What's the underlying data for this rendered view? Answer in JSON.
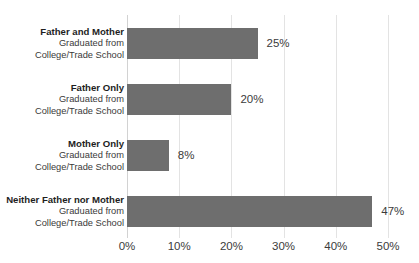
{
  "chart_data": {
    "type": "bar",
    "orientation": "horizontal",
    "title": "",
    "subtitle": "",
    "xlabel": "",
    "ylabel": "",
    "xlim": [
      0,
      50
    ],
    "grid": true,
    "legend": false,
    "bar_color": "#6e6e6e",
    "gridline_color": "#e3e3e3",
    "axis_color": "#d2d2d2",
    "xticks": [
      0,
      10,
      20,
      30,
      40,
      50
    ],
    "xtick_labels": [
      "0%",
      "10%",
      "20%",
      "30%",
      "40%",
      "50%"
    ],
    "categories": [
      "Father and Mother Graduated from College/Trade School",
      "Father Only Graduated from College/Trade School",
      "Mother Only Graduated from College/Trade School",
      "Neither Father nor Mother Graduated from College/Trade School"
    ],
    "category_lines": [
      [
        "Father and Mother",
        "Graduated from",
        "College/Trade School"
      ],
      [
        "Father Only",
        "Graduated from",
        "College/Trade School"
      ],
      [
        "Mother Only",
        "Graduated from",
        "College/Trade School"
      ],
      [
        "Neither Father nor Mother",
        "Graduated from",
        "College/Trade School"
      ]
    ],
    "values": [
      25,
      20,
      8,
      47
    ],
    "value_labels": [
      "25%",
      "20%",
      "8%",
      "47%"
    ]
  }
}
